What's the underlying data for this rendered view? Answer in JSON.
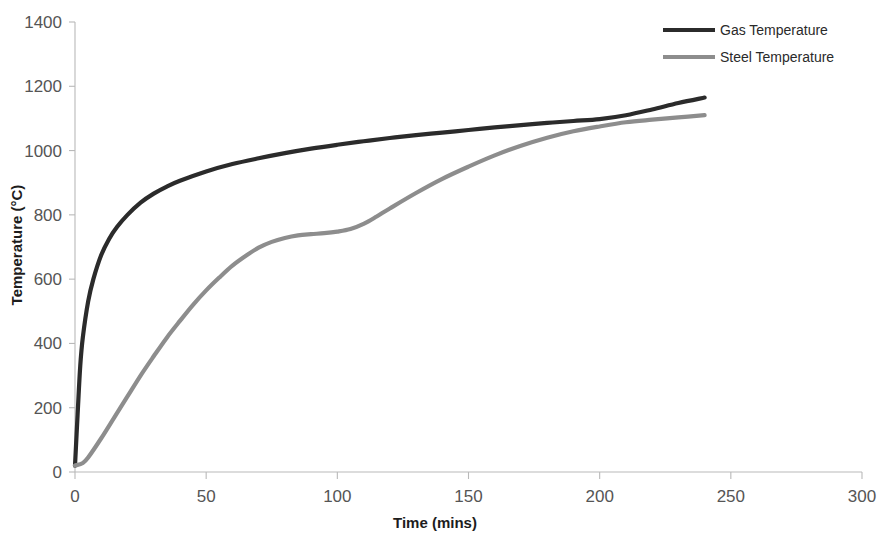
{
  "chart_data": {
    "type": "line",
    "title": "",
    "xlabel": "Time (mins)",
    "ylabel": "Temperature (°C)",
    "xlim": [
      0,
      300
    ],
    "ylim": [
      0,
      1400
    ],
    "xticks": [
      0,
      50,
      100,
      150,
      200,
      250,
      300
    ],
    "yticks": [
      0,
      200,
      400,
      600,
      800,
      1000,
      1200,
      1400
    ],
    "xtick_labels": [
      "0",
      "50",
      "100",
      "150",
      "200",
      "250",
      "300"
    ],
    "ytick_labels": [
      "0",
      "200",
      "400",
      "600",
      "800",
      "1000",
      "1200",
      "1400"
    ],
    "grid": false,
    "legend_position": "top-right",
    "background": "#ffffff",
    "series": [
      {
        "name": "Gas Temperature",
        "color": "#2b2b2b",
        "line_width": 4.2,
        "x": [
          0,
          1,
          2,
          3,
          5,
          7,
          10,
          13,
          16,
          20,
          25,
          30,
          35,
          40,
          50,
          60,
          70,
          80,
          90,
          100,
          110,
          120,
          130,
          140,
          150,
          160,
          170,
          180,
          190,
          200,
          210,
          220,
          230,
          240
        ],
        "y": [
          20,
          180,
          330,
          420,
          530,
          600,
          675,
          725,
          762,
          800,
          838,
          866,
          888,
          906,
          935,
          958,
          976,
          992,
          1006,
          1018,
          1029,
          1039,
          1048,
          1056,
          1064,
          1072,
          1079,
          1086,
          1092,
          1098,
          1110,
          1128,
          1148,
          1165
        ]
      },
      {
        "name": "Steel Temperature",
        "color": "#8d8d8d",
        "line_width": 4.2,
        "x": [
          0,
          3,
          5,
          10,
          15,
          20,
          25,
          30,
          35,
          40,
          45,
          50,
          55,
          60,
          65,
          70,
          75,
          80,
          85,
          90,
          95,
          100,
          105,
          110,
          115,
          120,
          130,
          140,
          150,
          160,
          170,
          180,
          190,
          200,
          210,
          220,
          230,
          240
        ],
        "y": [
          20,
          28,
          45,
          105,
          170,
          235,
          300,
          360,
          418,
          470,
          520,
          565,
          605,
          642,
          672,
          698,
          716,
          728,
          736,
          740,
          743,
          748,
          756,
          772,
          795,
          820,
          868,
          912,
          950,
          985,
          1015,
          1040,
          1060,
          1075,
          1088,
          1096,
          1103,
          1110
        ]
      }
    ]
  },
  "legend": {
    "items": [
      {
        "label": "Gas Temperature",
        "color": "#2b2b2b"
      },
      {
        "label": "Steel Temperature",
        "color": "#8d8d8d"
      }
    ]
  },
  "axes": {
    "x_title": "Time (mins)",
    "y_title": "Temperature (°C)"
  }
}
